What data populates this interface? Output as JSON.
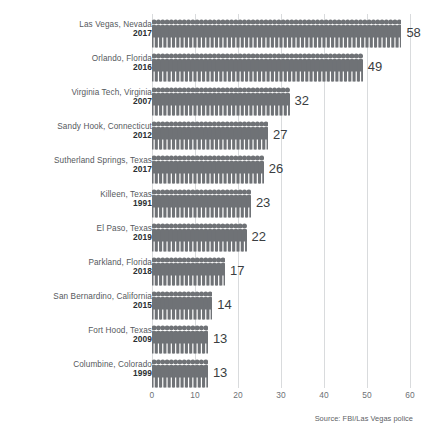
{
  "chart_data": {
    "type": "bar",
    "title": "",
    "subtitle": "",
    "xlabel": "",
    "ylabel": "",
    "orientation": "horizontal",
    "style": "pictogram",
    "icon": "person-icon",
    "grid": true,
    "legend": "none",
    "xlim": [
      0,
      62
    ],
    "xticks": [
      0,
      10,
      20,
      30,
      40,
      50,
      60
    ],
    "xtick_labels": [
      "0",
      "10",
      "20",
      "30",
      "40",
      "50",
      "60"
    ],
    "categories": [
      "Las Vegas, Nevada 2017",
      "Orlando, Florida 2016",
      "Virginia Tech, Virginia 2007",
      "Sandy Hook, Connecticut 2012",
      "Sutherland Springs, Texas 2017",
      "Killeen, Texas 1991",
      "El Paso, Texas 2019",
      "Parkland, Florida 2018",
      "San Bernardino, California 2015",
      "Fort Hood, Texas 2009",
      "Columbine, Colorado 1999"
    ],
    "values": [
      58,
      49,
      32,
      27,
      26,
      23,
      22,
      17,
      14,
      13,
      13
    ],
    "source": "Source: FBI/Las Vegas police",
    "bar_color": "#6f7276",
    "grid_color": "#d9dbdd"
  },
  "rows": [
    {
      "place": "Las Vegas, Nevada",
      "year": "2017",
      "value": 58,
      "value_label": "58"
    },
    {
      "place": "Orlando, Florida",
      "year": "2016",
      "value": 49,
      "value_label": "49"
    },
    {
      "place": "Virginia Tech, Virginia",
      "year": "2007",
      "value": 32,
      "value_label": "32"
    },
    {
      "place": "Sandy Hook, Connecticut",
      "year": "2012",
      "value": 27,
      "value_label": "27"
    },
    {
      "place": "Sutherland Springs, Texas",
      "year": "2017",
      "value": 26,
      "value_label": "26"
    },
    {
      "place": "Killeen, Texas",
      "year": "1991",
      "value": 23,
      "value_label": "23"
    },
    {
      "place": "El Paso, Texas",
      "year": "2019",
      "value": 22,
      "value_label": "22"
    },
    {
      "place": "Parkland, Florida",
      "year": "2018",
      "value": 17,
      "value_label": "17"
    },
    {
      "place": "San Bernardino, California",
      "year": "2015",
      "value": 14,
      "value_label": "14"
    },
    {
      "place": "Fort Hood, Texas",
      "year": "2009",
      "value": 13,
      "value_label": "13"
    },
    {
      "place": "Columbine, Colorado",
      "year": "1999",
      "value": 13,
      "value_label": "13"
    }
  ],
  "axis": {
    "ticks": [
      "0",
      "10",
      "20",
      "30",
      "40",
      "50",
      "60"
    ]
  },
  "footer": {
    "source": "Source: FBI/Las Vegas police"
  }
}
